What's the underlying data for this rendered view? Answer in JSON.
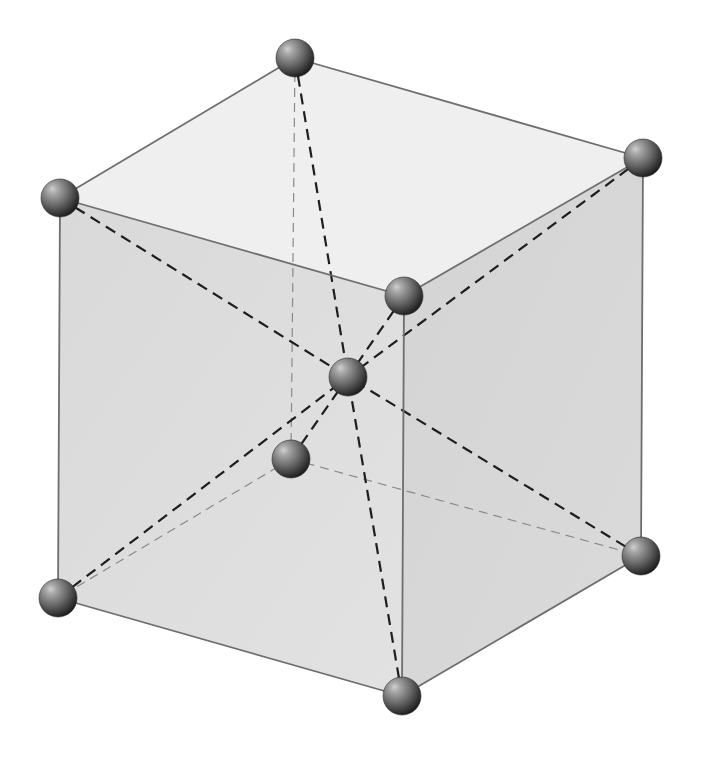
{
  "diagram": {
    "colors": {
      "background": "#ffffff",
      "top_face": "#efefef",
      "front_face": "#dcdcdc",
      "right_face": "#d6d6d6",
      "edge": "#6e6e6e",
      "hidden_edge": "#8a8a8a",
      "diagonal": "#1e1e1e",
      "atom_highlight": "#d0d0d0",
      "atom_mid": "#6a6a6a",
      "atom_shadow": "#1a1a1a"
    },
    "atom_radius": 19,
    "corners": {
      "top_back": [
        295,
        58
      ],
      "top_right": [
        643,
        158
      ],
      "top_front": [
        404,
        296
      ],
      "top_left": [
        60,
        198
      ],
      "bottom_back": [
        291,
        459
      ],
      "bottom_right": [
        641,
        556
      ],
      "bottom_front": [
        402,
        696
      ],
      "bottom_left": [
        58,
        598
      ]
    },
    "center_atom": [
      348,
      377
    ],
    "atoms": [
      {
        "id": "top_back",
        "x": 295,
        "y": 58
      },
      {
        "id": "top_right",
        "x": 643,
        "y": 158
      },
      {
        "id": "top_left",
        "x": 60,
        "y": 198
      },
      {
        "id": "top_front",
        "x": 404,
        "y": 296
      },
      {
        "id": "center",
        "x": 348,
        "y": 377
      },
      {
        "id": "bottom_back",
        "x": 291,
        "y": 459
      },
      {
        "id": "bottom_right",
        "x": 641,
        "y": 556
      },
      {
        "id": "bottom_left",
        "x": 58,
        "y": 598
      },
      {
        "id": "bottom_front",
        "x": 402,
        "y": 696
      }
    ]
  }
}
